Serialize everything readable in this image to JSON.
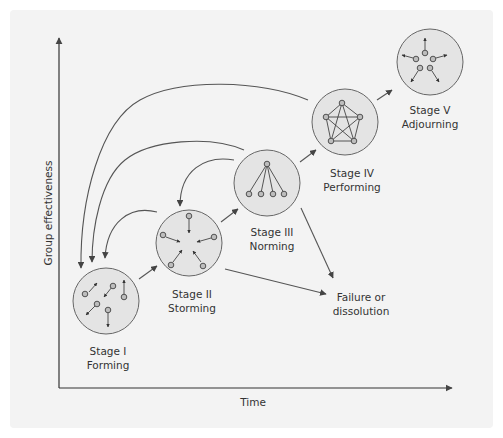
{
  "axes": {
    "x_label": "Time",
    "y_label": "Group effectiveness"
  },
  "stages": [
    {
      "line1": "Stage I",
      "line2": "Forming"
    },
    {
      "line1": "Stage II",
      "line2": "Storming"
    },
    {
      "line1": "Stage III",
      "line2": "Norming"
    },
    {
      "line1": "Stage IV",
      "line2": "Performing"
    },
    {
      "line1": "Stage V",
      "line2": "Adjourning"
    }
  ],
  "failure": {
    "line1": "Failure or",
    "line2": "dissolution"
  },
  "colors": {
    "panel": "#f3f3f3",
    "circle_fill": "#e4e4e4",
    "stroke": "#555555",
    "text": "#333333"
  }
}
